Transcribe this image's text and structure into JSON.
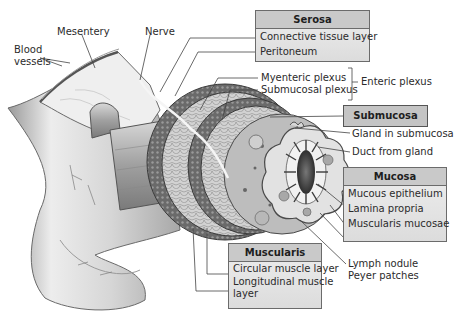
{
  "diagram": {
    "colors": {
      "background": "#ffffff",
      "label_box_header": "#c9c9c9",
      "label_box_body": "#e6e6e6",
      "box_border": "#6b6b6b",
      "tissue_light": "#e8e8e8",
      "tissue_mid": "#b5b5b5",
      "tissue_dark": "#5a5a5a",
      "leader_line": "#444444"
    },
    "free_labels": {
      "blood_vessels_line1": "Blood",
      "blood_vessels_line2": "vessels",
      "mesentery": "Mesentery",
      "nerve": "Nerve",
      "myenteric_plexus": "Myenteric plexus",
      "submucosal_plexus": "Submucosal plexus",
      "enteric_plexus": "Enteric plexus",
      "gland_in_submucosa": "Gland in submucosa",
      "duct_from_gland": "Duct from gland",
      "lymph_nodule": "Lymph nodule",
      "peyer_patches": "Peyer patches"
    },
    "boxes": {
      "serosa": {
        "title": "Serosa",
        "items": [
          "Connective tissue layer",
          "Peritoneum"
        ]
      },
      "submucosa": {
        "title": "Submucosa"
      },
      "mucosa": {
        "title": "Mucosa",
        "items": [
          "Mucous epithelium",
          "Lamina propria",
          "Muscularis mucosae"
        ]
      },
      "muscularis": {
        "title": "Muscularis",
        "items": [
          "Circular muscle layer",
          "Longitudinal muscle",
          "layer"
        ]
      }
    }
  }
}
